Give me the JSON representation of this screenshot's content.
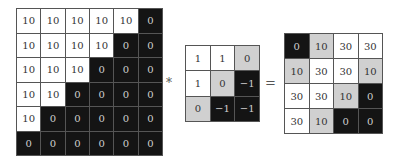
{
  "diagram": {
    "operators": {
      "convolution": "*",
      "equals": "="
    },
    "colors": {
      "white": "#ffffff",
      "gray": "#d0d0d0",
      "black": "#141414",
      "border": "#555555"
    },
    "input": {
      "rows": 6,
      "cols": 6,
      "values": [
        [
          "10",
          "10",
          "10",
          "10",
          "10",
          "0"
        ],
        [
          "10",
          "10",
          "10",
          "10",
          "0",
          "0"
        ],
        [
          "10",
          "10",
          "10",
          "0",
          "0",
          "0"
        ],
        [
          "10",
          "10",
          "0",
          "0",
          "0",
          "0"
        ],
        [
          "10",
          "0",
          "0",
          "0",
          "0",
          "0"
        ],
        [
          "0",
          "0",
          "0",
          "0",
          "0",
          "0"
        ]
      ],
      "shades": [
        [
          "w",
          "w",
          "w",
          "w",
          "w",
          "b"
        ],
        [
          "w",
          "w",
          "w",
          "w",
          "b",
          "b"
        ],
        [
          "w",
          "w",
          "w",
          "b",
          "b",
          "b"
        ],
        [
          "w",
          "w",
          "b",
          "b",
          "b",
          "b"
        ],
        [
          "w",
          "b",
          "b",
          "b",
          "b",
          "b"
        ],
        [
          "b",
          "b",
          "b",
          "b",
          "b",
          "b"
        ]
      ]
    },
    "kernel": {
      "rows": 3,
      "cols": 3,
      "values": [
        [
          "1",
          "1",
          "0"
        ],
        [
          "1",
          "0",
          "−1"
        ],
        [
          "0",
          "−1",
          "−1"
        ]
      ],
      "shades": [
        [
          "w",
          "w",
          "g"
        ],
        [
          "w",
          "g",
          "b"
        ],
        [
          "g",
          "b",
          "b"
        ]
      ]
    },
    "output": {
      "rows": 4,
      "cols": 4,
      "values": [
        [
          "0",
          "10",
          "30",
          "30"
        ],
        [
          "10",
          "30",
          "30",
          "10"
        ],
        [
          "30",
          "30",
          "10",
          "0"
        ],
        [
          "30",
          "10",
          "0",
          "0"
        ]
      ],
      "shades": [
        [
          "b",
          "g",
          "w",
          "w"
        ],
        [
          "g",
          "w",
          "w",
          "g"
        ],
        [
          "w",
          "w",
          "g",
          "b"
        ],
        [
          "w",
          "g",
          "b",
          "b"
        ]
      ]
    }
  }
}
